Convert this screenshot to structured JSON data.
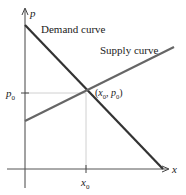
{
  "diagram": {
    "type": "supply-demand",
    "axes": {
      "x_label": "x",
      "y_label": "p"
    },
    "curves": {
      "demand_label": "Demand curve",
      "supply_label": "Supply curve"
    },
    "equilibrium": {
      "label": "(x0, p0)",
      "x_tick_label": "x",
      "x_tick_sub": "0",
      "y_tick_label": "p",
      "y_tick_sub": "0",
      "point_x": "x",
      "point_x_sub": "0",
      "point_sep": ", ",
      "point_p": "p",
      "point_p_sub": "0",
      "open_paren": "(",
      "close_paren": ")"
    },
    "colors": {
      "demand_line": "#333333",
      "supply_line": "#555555",
      "axis": "#444444",
      "guide": "#bbbbbb"
    }
  }
}
